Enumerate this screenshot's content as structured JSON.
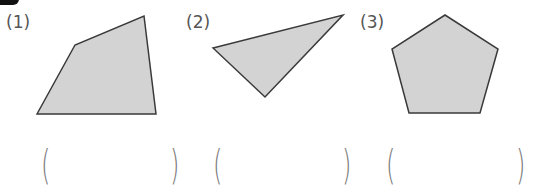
{
  "problems": [
    {
      "label": "(1)",
      "shape": "quadrilateral",
      "points": "37,114 75,45 144,16 156,114",
      "answer_open": "(",
      "answer_close": ")",
      "answer_value": ""
    },
    {
      "label": "(2)",
      "shape": "triangle",
      "points": "213,48 343,15 265,97",
      "answer_open": "(",
      "answer_close": ")",
      "answer_value": ""
    },
    {
      "label": "(3)",
      "shape": "pentagon",
      "points": "445,15 498,49 480,113 409,113 392,49",
      "answer_open": "(",
      "answer_close": ")",
      "answer_value": ""
    }
  ],
  "colors": {
    "shape_fill": "#d3d3d3",
    "shape_stroke": "#3a3a3a",
    "label_text": "#555555",
    "paren": "#7a7a7a"
  }
}
